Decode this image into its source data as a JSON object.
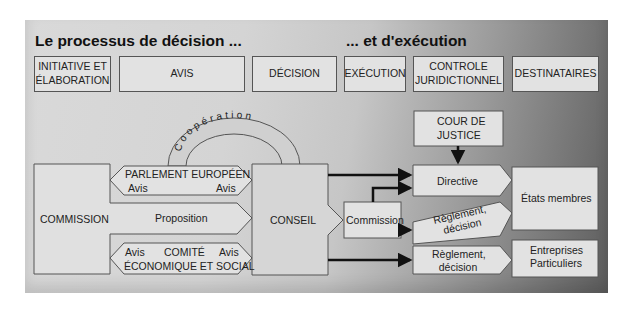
{
  "titles": {
    "decision": "Le processus de décision ...",
    "execution": "... et d'exécution"
  },
  "header": {
    "initiative": [
      "INITIATIVE ET",
      "ÉLABORATION"
    ],
    "avis": "AVIS",
    "decision": "DÉCISION",
    "execution": "EXÉCUTION",
    "controle": [
      "CONTROLE",
      "JURIDICTIONNEL"
    ],
    "destinataires": "DESTINATAIRES"
  },
  "nodes": {
    "commission": "COMMISSION",
    "parlement": "PARLEMENT EUROPÉEN",
    "parlement_avis_left": "Avis",
    "parlement_avis_right": "Avis",
    "proposition": "Proposition",
    "comite_line1": "COMITÉ",
    "comite_line2": "ÉCONOMIQUE ET SOCIAL",
    "comite_avis_left": "Avis",
    "comite_avis_right": "Avis",
    "cooperation": "Coopération",
    "conseil": "CONSEIL",
    "commission_exec": "Commission",
    "cour": [
      "COUR DE",
      "JUSTICE"
    ],
    "directive": "Directive",
    "reglement_1": [
      "Règlement,",
      "décision"
    ],
    "reglement_2": [
      "Règlement,",
      "décision"
    ],
    "etats": "États membres",
    "entreprises": [
      "Entreprises",
      "Particuliers"
    ]
  },
  "colors": {
    "box_fill": "#e2e2e2",
    "border": "#555555",
    "arrow": "#111111"
  }
}
